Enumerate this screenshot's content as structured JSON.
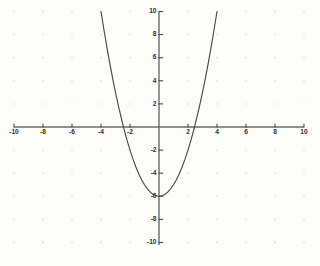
{
  "chart_data": {
    "type": "line",
    "title": "",
    "subtitle": "",
    "xlabel": "",
    "ylabel": "",
    "xlim": [
      -10,
      10
    ],
    "ylim": [
      -10,
      10
    ],
    "grid": true,
    "grid_style": "dotted",
    "grid_step": 2,
    "legend": "none",
    "equation": "y = x^2 - 6",
    "vertex": [
      0,
      -6
    ],
    "x_roots": [
      -2.449,
      2.449
    ],
    "y_intercept": -6,
    "x_ticks": [
      -10,
      -8,
      -6,
      -4,
      -2,
      2,
      4,
      6,
      8,
      10
    ],
    "y_ticks": [
      10,
      8,
      6,
      4,
      2,
      -2,
      -4,
      -6,
      -8,
      -10
    ],
    "x_tick_labels": [
      "-10",
      "-8",
      "-6",
      "-4",
      "-2",
      "2",
      "4",
      "6",
      "8",
      "10"
    ],
    "y_tick_labels": [
      "10",
      "8",
      "6",
      "4",
      "2",
      "-2",
      "-4",
      "-6",
      "-8",
      "-10"
    ],
    "series": [
      {
        "name": "parabola",
        "color": "#4a4a4a",
        "x": [
          -4.0,
          -3.8,
          -3.6,
          -3.4,
          -3.2,
          -3.0,
          -2.8,
          -2.6,
          -2.4,
          -2.2,
          -2.0,
          -1.8,
          -1.6,
          -1.4,
          -1.2,
          -1.0,
          -0.8,
          -0.6,
          -0.4,
          -0.2,
          0.0,
          0.2,
          0.4,
          0.6,
          0.8,
          1.0,
          1.2,
          1.4,
          1.6,
          1.8,
          2.0,
          2.2,
          2.4,
          2.6,
          2.8,
          3.0,
          3.2,
          3.4,
          3.6,
          3.8,
          4.0
        ],
        "values": [
          10.0,
          8.44,
          6.96,
          5.56,
          4.24,
          3.0,
          1.84,
          0.76,
          -0.24,
          -1.16,
          -2.0,
          -2.76,
          -3.44,
          -4.04,
          -4.56,
          -5.0,
          -5.36,
          -5.64,
          -5.84,
          -5.96,
          -6.0,
          -5.96,
          -5.84,
          -5.64,
          -5.36,
          -5.0,
          -4.56,
          -4.04,
          -3.44,
          -2.76,
          -2.0,
          -1.16,
          -0.24,
          0.76,
          1.84,
          3.0,
          4.24,
          5.56,
          6.96,
          8.44,
          10.0
        ]
      }
    ],
    "colors": {
      "background": "#fcfcfa",
      "axis": "#6b6b6b",
      "curve": "#4a4a4a",
      "grid_dot": "#c9c9c4",
      "tick_label": "#2f2f2f"
    }
  }
}
